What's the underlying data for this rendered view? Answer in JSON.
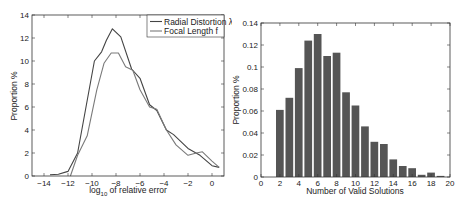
{
  "chart_data": [
    {
      "type": "line",
      "title": "",
      "xlabel": "log10 of relative error",
      "xlabel_main": "log",
      "xlabel_sub": "10",
      "xlabel_rest": " of relative error",
      "ylabel": "Proportion %",
      "xlim": [
        -15,
        1
      ],
      "ylim": [
        0,
        14
      ],
      "xticks": [
        -14,
        -12,
        -10,
        -8,
        -6,
        -4,
        -2,
        0
      ],
      "xtick_labels": [
        "−14",
        "−12",
        "−10",
        "−8",
        "−6",
        "−4",
        "−2",
        "0"
      ],
      "yticks": [
        0,
        2,
        4,
        6,
        8,
        10,
        12,
        14
      ],
      "ytick_labels": [
        "0",
        "2",
        "4",
        "6",
        "8",
        "10",
        "12",
        "14"
      ],
      "grid": false,
      "legend_position": "upper right",
      "series": [
        {
          "name": "Radial Distortion λ",
          "color": "#444444",
          "x": [
            -13.5,
            -12.8,
            -12.0,
            -11.2,
            -10.5,
            -9.8,
            -9.2,
            -8.8,
            -8.3,
            -7.6,
            -6.7,
            -6.0,
            -5.2,
            -4.6,
            -3.8,
            -3.2,
            -2.0,
            -1.0,
            0.0,
            0.6
          ],
          "y": [
            0.1,
            0.15,
            0.4,
            2.0,
            6.0,
            10.0,
            10.8,
            11.8,
            12.8,
            12.1,
            9.3,
            8.5,
            6.2,
            5.7,
            4.0,
            3.6,
            2.4,
            1.8,
            0.9,
            0.75
          ]
        },
        {
          "name": "Focal Length f",
          "color": "#7a7a7a",
          "x": [
            -11.8,
            -11.2,
            -10.4,
            -9.6,
            -9.0,
            -8.4,
            -7.8,
            -7.2,
            -6.6,
            -6.0,
            -5.2,
            -4.6,
            -3.8,
            -3.0,
            -2.0,
            -1.3,
            -0.8,
            0.0,
            0.6
          ],
          "y": [
            0.0,
            1.8,
            3.5,
            7.5,
            9.8,
            10.7,
            10.7,
            9.5,
            9.2,
            7.5,
            6.0,
            5.8,
            4.0,
            2.7,
            1.8,
            2.0,
            2.1,
            1.3,
            0.75
          ]
        }
      ]
    },
    {
      "type": "bar",
      "title": "",
      "xlabel": "Number of Valid Solutions",
      "ylabel": "Proportion %",
      "xlim": [
        0,
        20
      ],
      "ylim": [
        0,
        0.14
      ],
      "xticks": [
        0,
        2,
        4,
        6,
        8,
        10,
        12,
        14,
        16,
        18,
        20
      ],
      "xtick_labels": [
        "0",
        "2",
        "4",
        "6",
        "8",
        "10",
        "12",
        "14",
        "16",
        "18",
        "20"
      ],
      "yticks": [
        0,
        0.02,
        0.04,
        0.06,
        0.08,
        0.1,
        0.12,
        0.14
      ],
      "ytick_labels": [
        "0",
        "0.02",
        "0.04",
        "0.06",
        "0.08",
        "0.1",
        "0.12",
        "0.14"
      ],
      "grid": false,
      "bar_color": "#555555",
      "categories": [
        2,
        3,
        4,
        5,
        6,
        7,
        8,
        9,
        10,
        11,
        12,
        13,
        14,
        15,
        16,
        17,
        18,
        19
      ],
      "values": [
        0.061,
        0.072,
        0.099,
        0.124,
        0.13,
        0.11,
        0.113,
        0.077,
        0.065,
        0.046,
        0.032,
        0.03,
        0.016,
        0.01,
        0.008,
        0.002,
        0.004,
        0.001
      ]
    }
  ]
}
